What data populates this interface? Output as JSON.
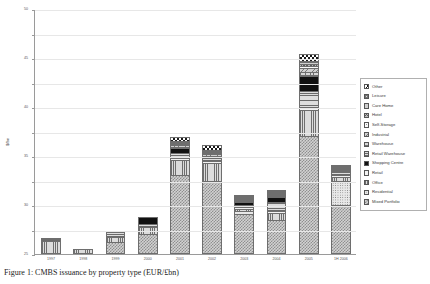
{
  "chart_data": {
    "type": "bar",
    "stacked": true,
    "title": "",
    "xlabel": "",
    "ylabel": "$/bn",
    "ylim": [
      0,
      50
    ],
    "yticks": [
      0,
      5,
      10,
      15,
      20,
      25,
      30,
      35,
      40,
      45,
      50
    ],
    "grid": true,
    "legend_position": "right",
    "categories": [
      "1997",
      "1998",
      "1999",
      "2000",
      "2001",
      "2002",
      "2003",
      "2004",
      "2005",
      "1H 2006"
    ],
    "series": [
      {
        "name": "Mixed Portfolio",
        "pattern": "checkerboard-grey",
        "values": [
          0.0,
          0.0,
          2.2,
          4.0,
          16.0,
          14.8,
          8.4,
          7.0,
          24.0,
          10.0
        ]
      },
      {
        "name": "Residential",
        "pattern": "dotted",
        "values": [
          0.0,
          0.0,
          0.0,
          0.0,
          0.0,
          0.0,
          0.8,
          0.0,
          0.0,
          5.2
        ]
      },
      {
        "name": "Office",
        "pattern": "vertical-lines",
        "values": [
          2.6,
          1.0,
          1.2,
          1.4,
          3.2,
          3.8,
          0.4,
          1.6,
          5.2,
          1.0
        ]
      },
      {
        "name": "Retail",
        "pattern": "solid-white",
        "values": [
          0.0,
          0.0,
          0.0,
          0.0,
          0.4,
          0.4,
          0.3,
          0.4,
          0.5,
          0.3
        ]
      },
      {
        "name": "Retail Warehouse",
        "pattern": "horizontal-lines",
        "values": [
          0.4,
          0.0,
          1.1,
          0.6,
          0.9,
          0.9,
          0.5,
          1.9,
          3.4,
          0.6
        ]
      },
      {
        "name": "Shopping Centre",
        "pattern": "solid-black",
        "values": [
          0.0,
          0.0,
          0.0,
          1.5,
          1.1,
          0.0,
          0.7,
          1.1,
          3.2,
          0.0
        ]
      },
      {
        "name": "Warehouse",
        "pattern": "fine-grid",
        "values": [
          0.0,
          0.0,
          0.0,
          0.0,
          0.3,
          0.2,
          0.2,
          0.2,
          0.9,
          0.2
        ]
      },
      {
        "name": "Industrial",
        "pattern": "diagonal-hatch",
        "values": [
          0.0,
          0.0,
          0.0,
          0.0,
          0.3,
          0.3,
          0.2,
          0.2,
          0.8,
          0.2
        ]
      },
      {
        "name": "Self-Storage",
        "pattern": "sparse-dots",
        "values": [
          0.0,
          0.0,
          0.0,
          0.0,
          0.2,
          0.2,
          0.1,
          0.1,
          0.4,
          0.1
        ]
      },
      {
        "name": "Hotel",
        "pattern": "cross-hatch-dark",
        "values": [
          0.0,
          0.0,
          0.0,
          0.0,
          0.2,
          0.2,
          0.1,
          0.1,
          0.4,
          0.1
        ]
      },
      {
        "name": "Care Home",
        "pattern": "grid-medium",
        "values": [
          0.0,
          0.0,
          0.0,
          0.0,
          0.2,
          0.2,
          0.1,
          0.1,
          0.3,
          0.1
        ]
      },
      {
        "name": "Leisure",
        "pattern": "grid-light",
        "values": [
          0.0,
          0.0,
          0.0,
          0.0,
          0.2,
          0.2,
          0.1,
          0.1,
          0.3,
          0.1
        ]
      },
      {
        "name": "Other",
        "pattern": "checkerboard-black",
        "values": [
          0.3,
          0.0,
          0.0,
          0.0,
          0.9,
          1.0,
          0.2,
          0.3,
          1.5,
          0.3
        ]
      }
    ],
    "totals": [
      3.3,
      1.0,
      4.5,
      7.5,
      23.9,
      22.2,
      12.1,
      13.1,
      40.9,
      18.2
    ]
  },
  "legend": {
    "items": [
      {
        "label": "Other"
      },
      {
        "label": "Leisure"
      },
      {
        "label": "Care Home"
      },
      {
        "label": "Hotel"
      },
      {
        "label": "Self-Storage"
      },
      {
        "label": "Industrial"
      },
      {
        "label": "Warehouse"
      },
      {
        "label": "Retail Warehouse"
      },
      {
        "label": "Shopping Centre"
      },
      {
        "label": "Retail"
      },
      {
        "label": "Office"
      },
      {
        "label": "Residential"
      },
      {
        "label": "Mixed Portfolio"
      }
    ]
  },
  "caption": {
    "text": "Figure 1: CMBS issuance by property type (EUR/£bn)"
  }
}
